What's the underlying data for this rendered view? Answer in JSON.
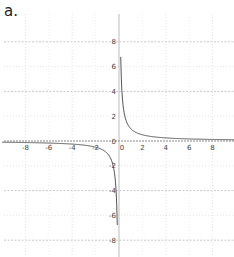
{
  "figure_label": "a.",
  "chart_data": {
    "type": "line",
    "title": "",
    "function": "y = 1/x",
    "xlabel": "",
    "ylabel": "",
    "xlim": [
      -10,
      10
    ],
    "ylim": [
      -10,
      10
    ],
    "grid": true,
    "x_ticks": [
      -8,
      -6,
      -4,
      -2,
      0,
      2,
      4,
      6,
      8
    ],
    "y_ticks": [
      -8,
      -6,
      -4,
      -2,
      0,
      2,
      4,
      6,
      8
    ],
    "x_tick_labels": [
      "-8",
      "-6",
      "-4",
      "-2",
      "0",
      "2",
      "4",
      "6",
      "8"
    ],
    "y_tick_labels": [
      "-8",
      "-6",
      "-4",
      "-2",
      "0",
      "2",
      "4",
      "6",
      "8"
    ],
    "series": [
      {
        "name": "right branch",
        "x": [
          0.1,
          0.125,
          0.2,
          0.25,
          0.5,
          1,
          2,
          4,
          6,
          8,
          10
        ],
        "y": [
          10,
          8,
          5,
          4,
          2,
          1,
          0.5,
          0.25,
          0.167,
          0.125,
          0.1
        ]
      },
      {
        "name": "left branch",
        "x": [
          -10,
          -8,
          -6,
          -4,
          -2,
          -1,
          -0.5,
          -0.25,
          -0.2,
          -0.125,
          -0.1
        ],
        "y": [
          -0.1,
          -0.125,
          -0.167,
          -0.25,
          -0.5,
          -1,
          -2,
          -4,
          -5,
          -8,
          -10
        ]
      }
    ],
    "colors": {
      "curve": "#555555",
      "axis": "#888888",
      "grid": "#cccccc"
    }
  }
}
